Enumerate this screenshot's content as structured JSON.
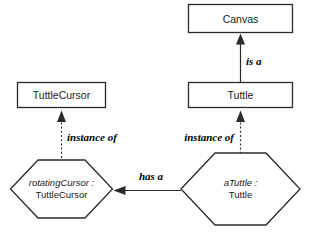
{
  "diagram": {
    "type": "uml-class-object-diagram",
    "background_color": "#ffffff",
    "stroke_color": "#2b2b2b",
    "classes": [
      {
        "id": "canvas",
        "label": "Canvas",
        "shape": "rectangle"
      },
      {
        "id": "tuttlecursor",
        "label": "TuttleCursor",
        "shape": "rectangle"
      },
      {
        "id": "tuttle",
        "label": "Tuttle",
        "shape": "rectangle"
      }
    ],
    "objects": [
      {
        "id": "rotatingcursor",
        "shape": "hexagon",
        "name": "rotatingCursor",
        "separator": ":",
        "class_name": "TuttleCursor",
        "line1": "rotatingCursor :",
        "line2": "TuttleCursor"
      },
      {
        "id": "atuttle",
        "shape": "hexagon",
        "name": "aTuttle",
        "separator": ":",
        "class_name": "Tuttle",
        "line1": "aTuttle :",
        "line2": "Tuttle"
      }
    ],
    "relations": [
      {
        "id": "tuttle-is-a-canvas",
        "label": "is a",
        "from": "tuttle",
        "to": "canvas",
        "line_style": "solid",
        "arrow": "filled-triangle"
      },
      {
        "id": "rotatingcursor-instance-of-tuttlecursor",
        "label": "instance of",
        "from": "rotatingcursor",
        "to": "tuttlecursor",
        "line_style": "dashed",
        "arrow": "filled-triangle"
      },
      {
        "id": "atuttle-instance-of-tuttle",
        "label": "instance of",
        "from": "atuttle",
        "to": "tuttle",
        "line_style": "dashed",
        "arrow": "filled-triangle"
      },
      {
        "id": "atuttle-has-a-rotatingcursor",
        "label": "has a",
        "from": "atuttle",
        "to": "rotatingcursor",
        "line_style": "solid",
        "arrow": "open-arrowhead"
      }
    ]
  }
}
